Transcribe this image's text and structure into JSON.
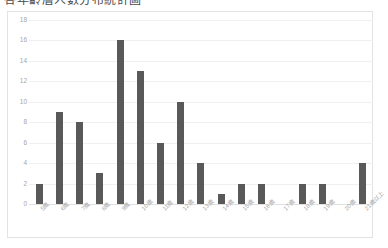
{
  "title": "各年齡層人數分布統計圖",
  "chart_data": {
    "type": "bar",
    "title": "各年齡層人數分布統計圖",
    "xlabel": "",
    "ylabel": "",
    "ylim": [
      0,
      18
    ],
    "ytick_step": 2,
    "yticks": [
      "18",
      "16",
      "14",
      "12",
      "10",
      "8",
      "6",
      "4",
      "2",
      "0"
    ],
    "grid": true,
    "legend": "none",
    "bar_color": "#595959",
    "gridline_color": "#f0f0f0",
    "frame_color": "#e3e3e3",
    "tick_label_color": "#a6a6a6",
    "categories": [
      "5歲",
      "6歲",
      "7歲",
      "8歲",
      "9歲",
      "10歲",
      "11歲",
      "12歲",
      "13歲",
      "14歲",
      "15歲",
      "16歲",
      "17歲",
      "18歲",
      "19歲",
      "20歲",
      "21歲以上"
    ],
    "values": [
      2,
      9,
      8,
      3,
      16,
      13,
      6,
      10,
      4,
      1,
      2,
      2,
      0,
      2,
      2,
      0,
      4
    ]
  }
}
